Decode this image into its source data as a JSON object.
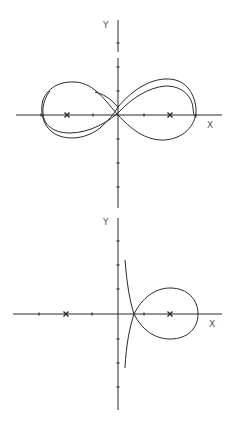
{
  "figure_top": {
    "title": "Two-center lemniscate-like curves (perturbed)",
    "x_axis_label": "X",
    "y_axis_label": "Y",
    "origin": [
      118,
      115
    ],
    "tick_spacing_px": 26,
    "centers": [
      "-2",
      "2"
    ],
    "curves": [
      "outer-figure-eight",
      "inner-figure-eight"
    ]
  },
  "figure_bottom": {
    "title": "Loop with asymptotic branches",
    "x_axis_label": "X",
    "y_axis_label": "Y",
    "origin": [
      118,
      314
    ],
    "tick_spacing_px": 26,
    "centers": [
      "-2",
      "2"
    ],
    "curves": [
      "loop-with-node"
    ]
  },
  "colors": {
    "line": "#2a2a2a",
    "label": "#555555",
    "background": "#ffffff"
  }
}
